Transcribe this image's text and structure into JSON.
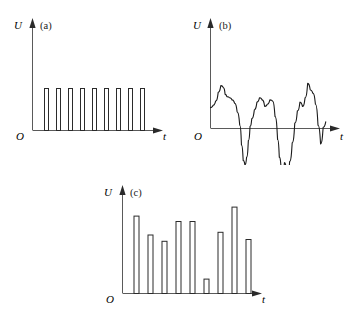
{
  "figure": {
    "background_color": "#ffffff",
    "line_color": "#1a1a1a",
    "axis_color": "#5a5a5a",
    "panels": [
      {
        "tag": "(a)",
        "y_axis_label": "U",
        "x_axis_label": "t",
        "origin_label": "O",
        "type": "pulse-train-uniform"
      },
      {
        "tag": "(b)",
        "y_axis_label": "U",
        "x_axis_label": "t",
        "origin_label": "O",
        "type": "analog-waveform"
      },
      {
        "tag": "(c)",
        "y_axis_label": "U",
        "x_axis_label": "t",
        "origin_label": "O",
        "type": "pulse-train-varying"
      }
    ]
  },
  "chart_data": [
    {
      "type": "bar",
      "title": "(a)",
      "xlabel": "t",
      "ylabel": "U",
      "grid": false,
      "legend": "none",
      "description": "Uniform rectangular pulse train: nine identical narrow pulses of equal height evenly spaced along the time axis.",
      "categories": [
        "p1",
        "p2",
        "p3",
        "p4",
        "p5",
        "p6",
        "p7",
        "p8",
        "p9"
      ],
      "values": [
        1,
        1,
        1,
        1,
        1,
        1,
        1,
        1,
        1
      ],
      "x_positions": [
        14,
        26,
        38,
        50,
        62,
        74,
        86,
        98,
        110
      ],
      "bar_width": 4,
      "ylim": [
        0,
        1.35
      ],
      "xlim": [
        0,
        132
      ]
    },
    {
      "type": "line",
      "title": "(b)",
      "xlabel": "t",
      "ylabel": "U",
      "grid": false,
      "legend": "none",
      "description": "Continuous irregular analog waveform oscillating above and below the time axis.",
      "x": [
        0,
        3,
        6,
        9,
        12,
        15,
        17,
        19,
        22,
        25,
        28,
        31,
        34,
        36,
        38,
        40,
        42,
        44,
        46,
        48,
        51,
        54,
        57,
        60,
        63,
        66,
        69,
        72,
        75,
        78,
        80,
        82,
        84,
        86,
        88,
        90,
        92,
        95,
        98,
        101,
        104,
        107,
        110,
        113,
        116,
        119,
        122,
        125,
        128,
        131,
        134
      ],
      "y": [
        0.38,
        0.42,
        0.5,
        0.66,
        0.78,
        0.74,
        0.62,
        0.58,
        0.56,
        0.52,
        0.46,
        0.3,
        0.06,
        -0.3,
        -0.58,
        -0.66,
        -0.52,
        -0.22,
        0.04,
        0.18,
        0.34,
        0.48,
        0.56,
        0.52,
        0.4,
        0.44,
        0.52,
        0.5,
        0.22,
        -0.2,
        -0.52,
        -0.7,
        -0.78,
        -0.62,
        -0.72,
        -0.84,
        -0.6,
        -0.26,
        0.1,
        0.32,
        0.48,
        0.4,
        0.56,
        0.82,
        0.7,
        0.64,
        0.44,
        0.06,
        -0.28,
        0.02,
        0.12
      ],
      "ylim": [
        -0.95,
        1.0
      ],
      "xlim": [
        0,
        140
      ]
    },
    {
      "type": "bar",
      "title": "(c)",
      "xlabel": "t",
      "ylabel": "U",
      "grid": false,
      "legend": "none",
      "description": "Rectangular pulse train with varying pulse amplitudes (pulse amplitude modulated samples): nine pulses of differing heights.",
      "categories": [
        "s1",
        "s2",
        "s3",
        "s4",
        "s5",
        "s6",
        "s7",
        "s8",
        "s9"
      ],
      "values": [
        0.86,
        0.65,
        0.58,
        0.8,
        0.8,
        0.16,
        0.68,
        0.96,
        0.6
      ],
      "x_positions": [
        14,
        28,
        42,
        56,
        70,
        84,
        98,
        112,
        126
      ],
      "bar_width": 5,
      "ylim": [
        0,
        1.1
      ],
      "xlim": [
        0,
        150
      ]
    }
  ]
}
